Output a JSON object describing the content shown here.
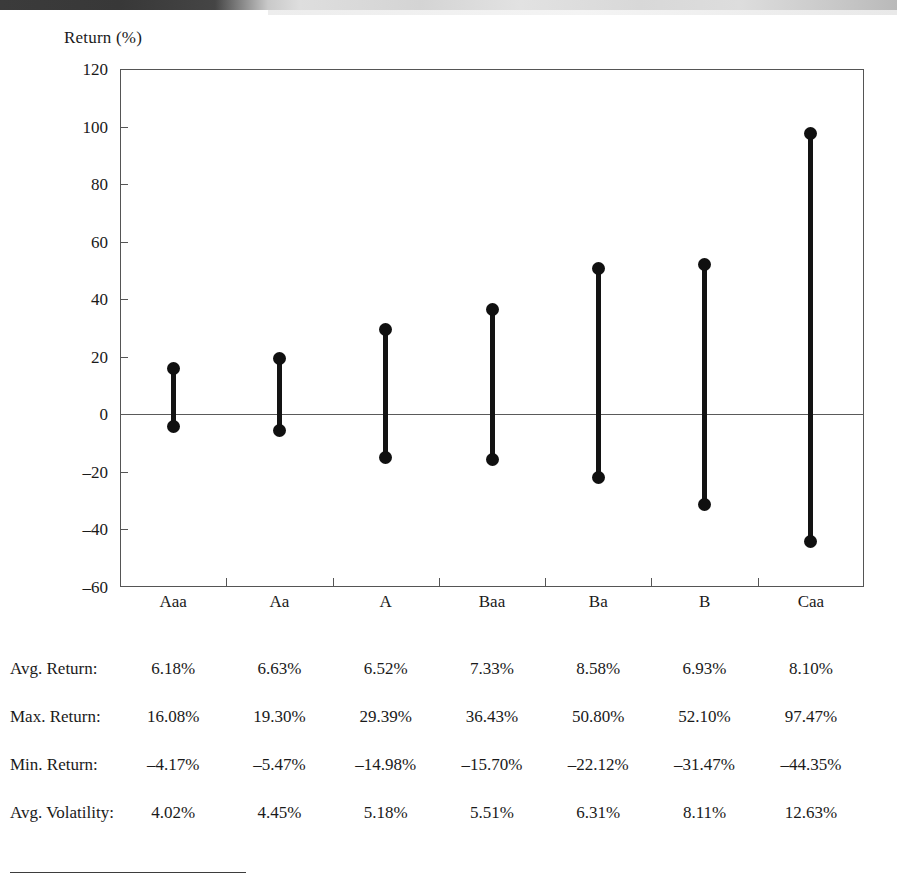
{
  "figure": {
    "y_axis_title": "Return (%)"
  },
  "chart_data": {
    "type": "bar",
    "title": "Return (%)",
    "subtitle": "",
    "xlabel": "",
    "ylabel": "Return (%)",
    "ylim": [
      -60,
      120
    ],
    "yticks": [
      120,
      100,
      80,
      60,
      40,
      20,
      0,
      -20,
      -40,
      -60
    ],
    "ytick_labels": [
      "120",
      "100",
      "80",
      "60",
      "40",
      "20",
      "0",
      "–20",
      "–40",
      "–60"
    ],
    "grid": false,
    "legend": "none",
    "zero_line": 0,
    "categories": [
      "Aaa",
      "Aa",
      "A",
      "Baa",
      "Ba",
      "B",
      "Caa"
    ],
    "series": [
      {
        "name": "Max. Return",
        "values": [
          16.08,
          19.3,
          29.39,
          36.43,
          50.8,
          52.1,
          97.47
        ]
      },
      {
        "name": "Min. Return",
        "values": [
          -4.17,
          -5.47,
          -14.98,
          -15.7,
          -22.12,
          -31.47,
          -44.35
        ]
      }
    ],
    "marker": "filled-circle",
    "connector": "vertical-line"
  },
  "stats": {
    "rows": [
      {
        "label": "Avg. Return:",
        "values": [
          "6.18%",
          "6.63%",
          "6.52%",
          "7.33%",
          "8.58%",
          "6.93%",
          "8.10%"
        ]
      },
      {
        "label": "Max. Return:",
        "values": [
          "16.08%",
          "19.30%",
          "29.39%",
          "36.43%",
          "50.80%",
          "52.10%",
          "97.47%"
        ]
      },
      {
        "label": "Min. Return:",
        "values": [
          "–4.17%",
          "–5.47%",
          "–14.98%",
          "–15.70%",
          "–22.12%",
          "–31.47%",
          "–44.35%"
        ]
      },
      {
        "label": "Avg. Volatility:",
        "values": [
          "4.02%",
          "4.45%",
          "5.18%",
          "5.51%",
          "6.31%",
          "8.11%",
          "12.63%"
        ]
      }
    ]
  }
}
